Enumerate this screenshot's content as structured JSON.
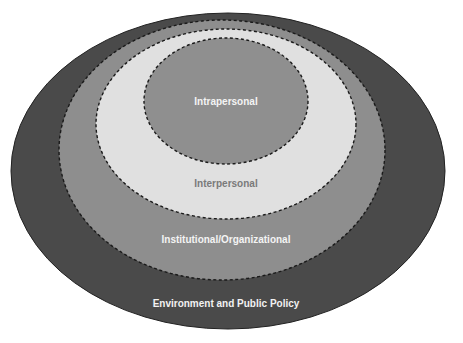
{
  "diagram": {
    "type": "nested-ellipses",
    "levels": [
      {
        "label": "Environment and Public Policy",
        "fill": "#4a4a4a",
        "text_color": "#f2f2f2",
        "border": "solid"
      },
      {
        "label": "Institutional/Organizational",
        "fill": "#8e8e8e",
        "text_color": "#f4f4f4",
        "border": "dashed"
      },
      {
        "label": "Interpersonal",
        "fill": "#e0e0e0",
        "text_color": "#7a7a7a",
        "border": "dashed"
      },
      {
        "label": "Intrapersonal",
        "fill": "#8f8f8f",
        "text_color": "#f4f4f4",
        "border": "dashed"
      }
    ]
  }
}
